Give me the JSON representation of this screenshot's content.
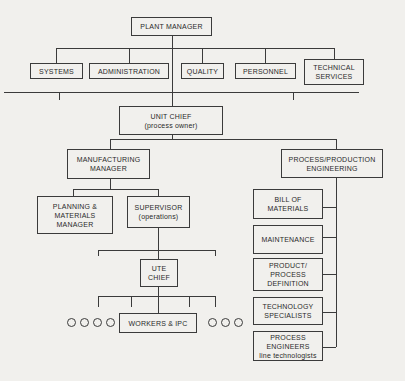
{
  "diagram": {
    "background_color": "#f1f0ed",
    "line_color": "#3b3b3b",
    "nodes": {
      "plant_manager": {
        "label": "PLANT MANAGER"
      },
      "systems": {
        "label": "SYSTEMS"
      },
      "administration": {
        "label": "ADMINISTRATION"
      },
      "quality": {
        "label": "QUALITY"
      },
      "personnel": {
        "label": "PERSONNEL"
      },
      "technical_services": {
        "lines": [
          "TECHNICAL",
          "SERVICES"
        ]
      },
      "unit_chief": {
        "lines": [
          "UNIT CHIEF",
          "(process owner)"
        ]
      },
      "manufacturing_manager": {
        "lines": [
          "MANUFACTURING",
          "MANAGER"
        ]
      },
      "process_production_engineering": {
        "lines": [
          "PROCESS/PRODUCTION",
          "ENGINEERING"
        ]
      },
      "planning_materials_manager": {
        "lines": [
          "PLANNING &",
          "MATERIALS",
          "MANAGER"
        ]
      },
      "supervisor": {
        "lines": [
          "SUPERVISOR",
          "(operations)"
        ]
      },
      "ute_chief": {
        "lines": [
          "UTE",
          "CHIEF"
        ]
      },
      "workers_ipc": {
        "label": "WORKERS & IPC"
      },
      "bill_of_materials": {
        "lines": [
          "BILL OF",
          "MATERIALS"
        ]
      },
      "maintenance": {
        "label": "MAINTENANCE"
      },
      "product_process_definition": {
        "lines": [
          "PRODUCT/",
          "PROCESS",
          "DEFINITION"
        ]
      },
      "technology_specialists": {
        "lines": [
          "TECHNOLOGY",
          "SPECIALISTS"
        ]
      },
      "process_engineers": {
        "lines": [
          "PROCESS",
          "ENGINEERS",
          "line technologists"
        ]
      }
    },
    "workers_circles": {
      "left_count": 4,
      "right_count": 3
    }
  }
}
